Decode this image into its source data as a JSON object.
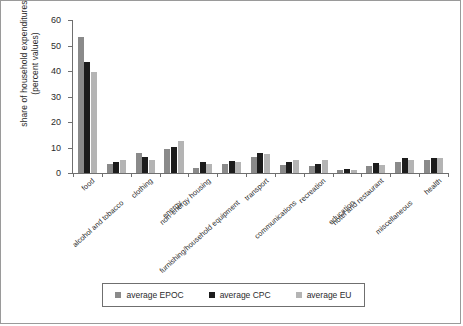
{
  "chart_data": {
    "type": "bar",
    "title": "",
    "xlabel": "",
    "ylabel": "share of household expenditures (percent values)",
    "ylim": [
      0,
      60
    ],
    "yticks": [
      0,
      10,
      20,
      30,
      40,
      50,
      60
    ],
    "grid": false,
    "legend_position": "bottom",
    "categories": [
      "food",
      "alcohol and tobacco",
      "clothing",
      "energy",
      "non-energy housing",
      "furnishing/household equipment",
      "transport",
      "communications",
      "recreation",
      "education",
      "hotel and restaurant",
      "miscellaneous",
      "health"
    ],
    "series": [
      {
        "name": "average EPOC",
        "color": "#8a8a8a",
        "values": [
          53.5,
          3.5,
          8.0,
          9.3,
          2.0,
          3.5,
          6.3,
          3.3,
          2.8,
          1.2,
          2.8,
          4.3,
          5.3
        ]
      },
      {
        "name": "average CPC",
        "color": "#1c1c1c",
        "values": [
          43.5,
          4.3,
          6.3,
          10.3,
          4.3,
          4.8,
          7.8,
          4.3,
          3.5,
          1.5,
          4.0,
          5.8,
          6.0
        ]
      },
      {
        "name": "average EU",
        "color": "#b4b4b4",
        "values": [
          39.5,
          5.2,
          5.3,
          12.5,
          3.5,
          4.5,
          7.3,
          5.3,
          5.3,
          1.0,
          3.3,
          5.3,
          6.0
        ]
      }
    ]
  },
  "legend": {
    "items": [
      {
        "label": "average EPOC",
        "color": "#8a8a8a"
      },
      {
        "label": "average CPC",
        "color": "#1c1c1c"
      },
      {
        "label": "average EU",
        "color": "#b4b4b4"
      }
    ]
  },
  "axis": {
    "y_title": "share of household expenditures (percent values)"
  }
}
